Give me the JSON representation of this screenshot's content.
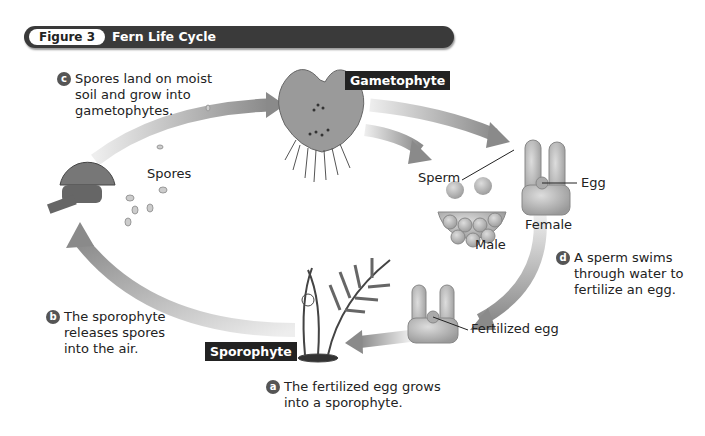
{
  "figure": {
    "number_label": "Figure 3",
    "title": "Fern Life Cycle"
  },
  "stages": {
    "gametophyte": "Gametophyte",
    "sporophyte": "Sporophyte"
  },
  "labels": {
    "spores": "Spores",
    "sperm": "Sperm",
    "egg": "Egg",
    "male": "Male",
    "female": "Female",
    "fertilized_egg": "Fertilized egg"
  },
  "steps": [
    {
      "badge": "a",
      "lines": [
        "The fertilized egg grows",
        "into a sporophyte."
      ]
    },
    {
      "badge": "b",
      "lines": [
        "The sporophyte",
        "releases spores",
        "into the air."
      ]
    },
    {
      "badge": "c",
      "lines": [
        "Spores land on moist",
        "soil and grow into",
        "gametophytes."
      ]
    },
    {
      "badge": "d",
      "lines": [
        "A sperm swims",
        "through water to",
        "fertilize an egg."
      ]
    }
  ],
  "colors": {
    "banner": "#3a3a3a",
    "arrow": "#8a8a8a",
    "badge": "#555555",
    "cell": "#b0b0b0"
  }
}
